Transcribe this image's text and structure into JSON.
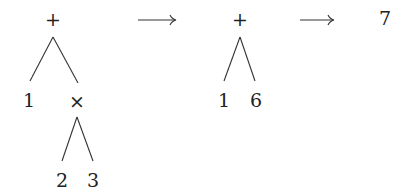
{
  "diagram": {
    "stages": [
      {
        "id": "stage1",
        "root": "+",
        "left_leaf": "1",
        "right_op": "×",
        "right_op_left": "2",
        "right_op_right": "3"
      },
      {
        "id": "stage2",
        "root": "+",
        "left_leaf": "1",
        "right_leaf": "6"
      },
      {
        "id": "stage3",
        "result": "7"
      }
    ],
    "arrows": [
      {
        "from": "stage1",
        "to": "stage2",
        "symbol": "→"
      },
      {
        "from": "stage2",
        "to": "stage3",
        "symbol": "→"
      }
    ]
  }
}
